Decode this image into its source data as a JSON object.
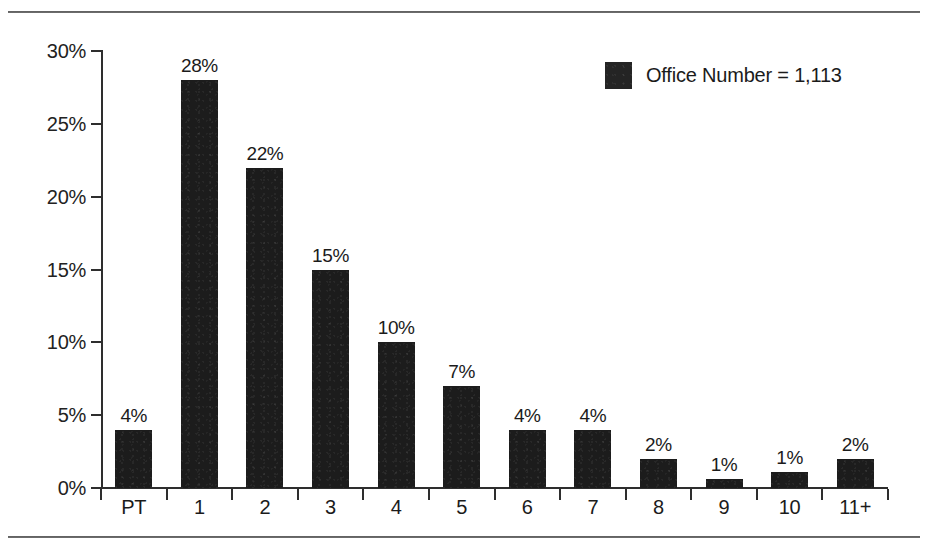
{
  "chart_data": {
    "type": "bar",
    "title": "",
    "subtitle": "",
    "xlabel": "",
    "ylabel": "",
    "categories": [
      "PT",
      "1",
      "2",
      "3",
      "4",
      "5",
      "6",
      "7",
      "8",
      "9",
      "10",
      "11+"
    ],
    "values": [
      4,
      28,
      22,
      15,
      10,
      7,
      4,
      4,
      2,
      1,
      1,
      2
    ],
    "drawn_values": [
      4,
      28,
      22,
      15,
      10,
      7,
      4,
      4,
      2,
      0.6,
      1.1,
      2
    ],
    "data_labels": [
      "4%",
      "28%",
      "22%",
      "15%",
      "10%",
      "7%",
      "4%",
      "4%",
      "2%",
      "1%",
      "1%",
      "2%"
    ],
    "ylim": [
      0,
      30
    ],
    "ytick_values": [
      0,
      5,
      10,
      15,
      20,
      25,
      30
    ],
    "ytick_labels": [
      "0%",
      "5%",
      "10%",
      "15%",
      "20%",
      "25%",
      "30%"
    ],
    "grid": false,
    "legend_position": "top-right",
    "legend": [
      {
        "label": "Office Number = 1,113",
        "color": "#1c1c1c",
        "swatch": "legend-swatch-office-number"
      }
    ],
    "series": [
      {
        "name": "Office Number = 1,113",
        "color": "#1c1c1c",
        "values": [
          4,
          28,
          22,
          15,
          10,
          7,
          4,
          4,
          2,
          1,
          1,
          2
        ]
      }
    ]
  },
  "colors": {
    "bar": "#1c1c1c",
    "axis": "#2e2e2e",
    "text": "#1b1b1b",
    "rule": "#4a4a4a",
    "background": "#ffffff"
  }
}
